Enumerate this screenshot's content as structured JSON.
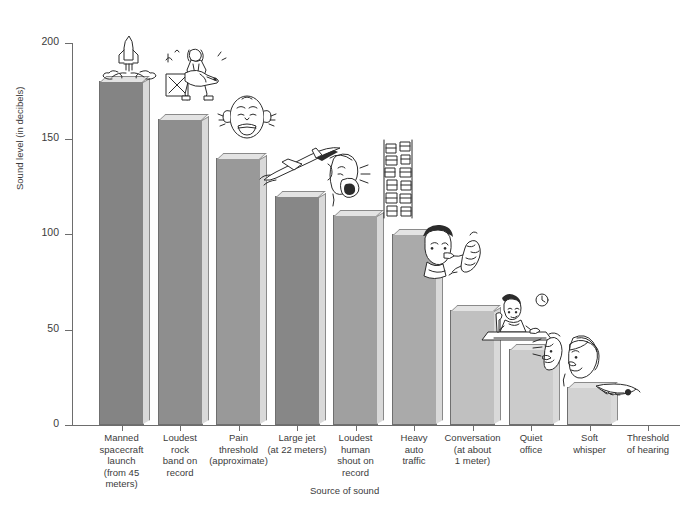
{
  "chart_data": {
    "type": "bar",
    "title": "",
    "subtitle": "",
    "xlabel": "Source of sound",
    "ylabel": "Sound level (in decibels)",
    "ylim": [
      0,
      200
    ],
    "yticks": [
      0,
      50,
      100,
      150,
      200
    ],
    "ytick_labels": [
      "0",
      "50",
      "100",
      "150",
      "200"
    ],
    "grid": false,
    "legend": "none",
    "units": "decibels",
    "categories": [
      "Manned spacecraft launch (from 45 meters)",
      "Loudest rock band on record",
      "Pain threshold (approximate)",
      "Large jet (at 22 meters)",
      "Loudest human shout on record",
      "Heavy auto traffic",
      "Conversation (at about 1 meter)",
      "Quiet office",
      "Soft whisper",
      "Threshold of hearing"
    ],
    "values": [
      180,
      160,
      140,
      120,
      110,
      100,
      60,
      40,
      20,
      0
    ],
    "bar_colors": [
      "#848484",
      "#8e8e8e",
      "#999999",
      "#878787",
      "#a0a0a0",
      "#aaaaaa",
      "#c0c0c0",
      "#cbcbcb",
      "#d2d2d2",
      "#ffffff"
    ]
  },
  "axes": {
    "y": {
      "title": "Sound level (in decibels)",
      "ticks": [
        {
          "label": "200",
          "value": 200
        },
        {
          "label": "150",
          "value": 150
        },
        {
          "label": "100",
          "value": 100
        },
        {
          "label": "50",
          "value": 50
        },
        {
          "label": "0",
          "value": 0
        }
      ]
    },
    "x": {
      "title": "Source of sound"
    }
  },
  "bars": [
    {
      "id": "manned-spacecraft-launch",
      "value": 180,
      "label_lines": [
        "Manned",
        "spacecraft",
        "launch",
        "(from 45",
        "meters)"
      ],
      "icon": "rocket-launch-doodle"
    },
    {
      "id": "loudest-rock-band",
      "value": 160,
      "label_lines": [
        "Loudest",
        "rock",
        "band on",
        "record"
      ],
      "icon": "rock-guitarist-doodle"
    },
    {
      "id": "pain-threshold",
      "value": 140,
      "label_lines": [
        "Pain",
        "threshold",
        "(approximate)"
      ],
      "icon": "grimacing-face-doodle"
    },
    {
      "id": "large-jet",
      "value": 120,
      "label_lines": [
        "Large jet",
        "(at 22 meters)"
      ],
      "icon": "jet-airplane-doodle"
    },
    {
      "id": "loudest-human-shout",
      "value": 110,
      "label_lines": [
        "Loudest",
        "human",
        "shout on",
        "record"
      ],
      "icon": "shouting-face-doodle"
    },
    {
      "id": "heavy-auto-traffic",
      "value": 100,
      "label_lines": [
        "Heavy",
        "auto",
        "traffic"
      ],
      "icon": "traffic-jam-doodle"
    },
    {
      "id": "conversation",
      "value": 60,
      "label_lines": [
        "Conversation",
        "(at about",
        "1 meter)"
      ],
      "icon": "two-people-talking-doodle"
    },
    {
      "id": "quiet-office",
      "value": 40,
      "label_lines": [
        "Quiet",
        "office"
      ],
      "icon": "office-worker-doodle"
    },
    {
      "id": "soft-whisper",
      "value": 20,
      "label_lines": [
        "Soft",
        "whisper"
      ],
      "icon": "whispering-pair-doodle"
    },
    {
      "id": "threshold-of-hearing",
      "value": 0,
      "label_lines": [
        "Threshold",
        "of hearing"
      ],
      "icon": "falling-feather-doodle"
    }
  ],
  "colors": {
    "axis": "#6d6d6d",
    "text": "#3b3b3b",
    "ink": "#2b2b2b",
    "bar_side": "#d9d9d9",
    "bar_top": "#e3e3e3"
  }
}
